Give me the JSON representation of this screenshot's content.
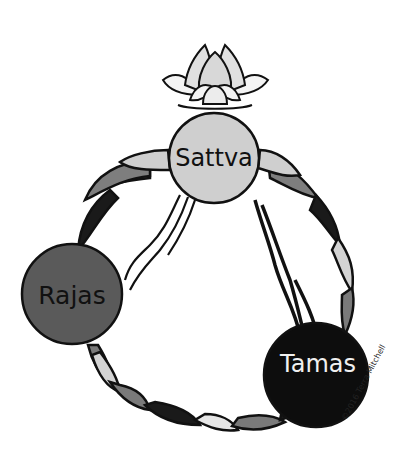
{
  "nodes": {
    "sattva": {
      "label": "Sattva",
      "fill": "#cfcfcf",
      "text_color": "#111111"
    },
    "rajas": {
      "label": "Rajas",
      "fill": "#5a5a5a",
      "text_color": "#111111"
    },
    "tamas": {
      "label": "Tamas",
      "fill": "#0d0d0d",
      "text_color": "#f0f0f0"
    }
  },
  "decorations": {
    "top_icon": "lotus-flower",
    "ring": "braided-rope",
    "connections": [
      "sattva-to-rajas-stream",
      "sattva-to-tamas-stream"
    ]
  },
  "credit": "©2016 Terra Mitchell",
  "colors": {
    "light": "#d9d9d9",
    "mid": "#7a7a7a",
    "dark": "#1a1a1a",
    "outline": "#111111"
  }
}
